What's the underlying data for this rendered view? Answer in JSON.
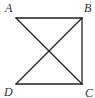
{
  "figure": {
    "type": "geometry-diagram",
    "stroke_color": "#222222",
    "label_color": "#333333",
    "points": {
      "A": {
        "label": "A",
        "x": 16,
        "y": 18
      },
      "B": {
        "label": "B",
        "x": 82,
        "y": 18
      },
      "C": {
        "label": "C",
        "x": 82,
        "y": 84
      },
      "D": {
        "label": "D",
        "x": 16,
        "y": 84
      }
    },
    "segments": [
      "AB",
      "BC",
      "DC",
      "AC",
      "BD"
    ]
  }
}
